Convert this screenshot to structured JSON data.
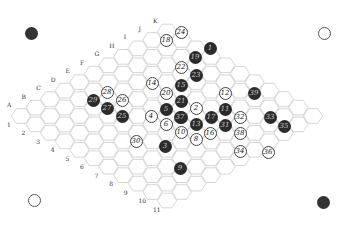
{
  "game": {
    "type": "Hex",
    "board_size": 11,
    "column_labels": [
      "A",
      "B",
      "C",
      "D",
      "E",
      "F",
      "G",
      "H",
      "I",
      "J",
      "K"
    ],
    "row_labels": [
      "1",
      "2",
      "3",
      "4",
      "5",
      "6",
      "7",
      "8",
      "9",
      "10",
      "11"
    ],
    "colors": {
      "black": "#2b2b2b",
      "white": "#ffffff",
      "grid": "#cccccc",
      "edge": "#555555"
    }
  },
  "corners": [
    {
      "pos": "top-left",
      "color": "black"
    },
    {
      "pos": "top-right",
      "color": "white"
    },
    {
      "pos": "bottom-left",
      "color": "white"
    },
    {
      "pos": "bottom-right",
      "color": "black"
    }
  ],
  "stones": [
    {
      "n": "1",
      "color": "b",
      "x": 210,
      "y": 48
    },
    {
      "n": "2",
      "color": "w",
      "x": 196,
      "y": 108
    },
    {
      "n": "3",
      "color": "b",
      "x": 165,
      "y": 146
    },
    {
      "n": "4",
      "color": "w",
      "x": 151,
      "y": 116
    },
    {
      "n": "5",
      "color": "b",
      "x": 166,
      "y": 109
    },
    {
      "n": "6",
      "color": "w",
      "x": 166,
      "y": 124
    },
    {
      "n": "7",
      "color": "b",
      "x": 181,
      "y": 117
    },
    {
      "n": "8",
      "color": "w",
      "x": 196,
      "y": 139
    },
    {
      "n": "9",
      "color": "b",
      "x": 180,
      "y": 168
    },
    {
      "n": "10",
      "color": "w",
      "x": 181,
      "y": 132
    },
    {
      "n": "11",
      "color": "b",
      "x": 225,
      "y": 109
    },
    {
      "n": "12",
      "color": "w",
      "x": 225,
      "y": 93
    },
    {
      "n": "13",
      "color": "b",
      "x": 196,
      "y": 124
    },
    {
      "n": "14",
      "color": "w",
      "x": 152,
      "y": 83
    },
    {
      "n": "15",
      "color": "b",
      "x": 181,
      "y": 85
    },
    {
      "n": "16",
      "color": "w",
      "x": 210,
      "y": 133
    },
    {
      "n": "17",
      "color": "b",
      "x": 211,
      "y": 117
    },
    {
      "n": "18",
      "color": "w",
      "x": 166,
      "y": 40
    },
    {
      "n": "19",
      "color": "b",
      "x": 195,
      "y": 57
    },
    {
      "n": "20",
      "color": "w",
      "x": 166,
      "y": 93
    },
    {
      "n": "21",
      "color": "b",
      "x": 181,
      "y": 101
    },
    {
      "n": "22",
      "color": "w",
      "x": 181,
      "y": 67
    },
    {
      "n": "23",
      "color": "b",
      "x": 196,
      "y": 75
    },
    {
      "n": "24",
      "color": "w",
      "x": 181,
      "y": 32
    },
    {
      "n": "25",
      "color": "b",
      "x": 122,
      "y": 116
    },
    {
      "n": "26",
      "color": "w",
      "x": 122,
      "y": 100
    },
    {
      "n": "27",
      "color": "b",
      "x": 107,
      "y": 108
    },
    {
      "n": "28",
      "color": "w",
      "x": 107,
      "y": 92
    },
    {
      "n": "29",
      "color": "b",
      "x": 93,
      "y": 100
    },
    {
      "n": "30",
      "color": "w",
      "x": 136,
      "y": 141
    },
    {
      "n": "31",
      "color": "b",
      "x": 225,
      "y": 125
    },
    {
      "n": "32",
      "color": "w",
      "x": 240,
      "y": 117
    },
    {
      "n": "33",
      "color": "b",
      "x": 270,
      "y": 117
    },
    {
      "n": "34",
      "color": "w",
      "x": 240,
      "y": 151
    },
    {
      "n": "35",
      "color": "b",
      "x": 284,
      "y": 126
    },
    {
      "n": "36",
      "color": "w",
      "x": 268,
      "y": 152
    },
    {
      "n": "37",
      "color": "b",
      "x": 180,
      "y": 117
    },
    {
      "n": "38",
      "color": "w",
      "x": 240,
      "y": 133
    },
    {
      "n": "39",
      "color": "b",
      "x": 254,
      "y": 93
    }
  ]
}
